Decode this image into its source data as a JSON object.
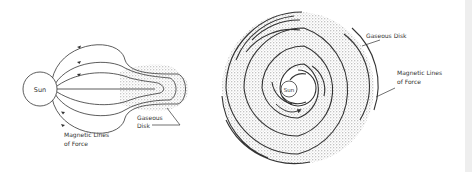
{
  "left_diagram": {
    "sun_label": "Sun",
    "disk_label_line1": "Gaseous",
    "disk_label_line2": "Disk",
    "lines_label_line1": "Magnetic Lines",
    "lines_label_line2": "of Force"
  },
  "right_diagram": {
    "sun_label": "Sun",
    "disk_label": "Gaseous Disk",
    "lines_label_line1": "Magnetic Lines",
    "lines_label_line2": "of Force"
  },
  "colors": {
    "line": "#333333",
    "stipple": "#9a9a9a",
    "background": "#ffffff"
  }
}
